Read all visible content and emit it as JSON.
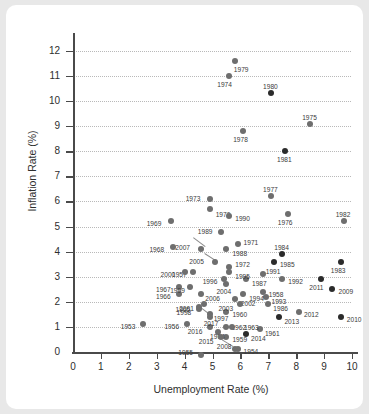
{
  "chart_data": {
    "type": "scatter",
    "title": "",
    "xlabel": "Unemployment Rate (%)",
    "ylabel": "Inflation Rate (%)",
    "xlim": [
      0,
      10.5
    ],
    "ylim": [
      0,
      12.4
    ],
    "xticks": [
      0,
      1,
      2,
      3,
      4,
      5,
      6,
      7,
      8,
      9,
      10
    ],
    "yticks": [
      0,
      1,
      2,
      3,
      4,
      5,
      6,
      7,
      8,
      9,
      10,
      11,
      12
    ],
    "grid": "horizontal-dotted",
    "legend": "none",
    "point_label_field": "year",
    "points": [
      {
        "year": "1953",
        "x": 2.5,
        "y": 1.1,
        "tone": "mid",
        "lx": -22,
        "ly": -1
      },
      {
        "year": "1954",
        "x": 5.9,
        "y": 0.1,
        "tone": "mid",
        "lx": 6,
        "ly": -1
      },
      {
        "year": "1955",
        "x": 4.6,
        "y": -0.1,
        "tone": "mid",
        "lx": -23,
        "ly": -6
      },
      {
        "year": "1956",
        "x": 4.1,
        "y": 1.1,
        "tone": "mid",
        "lx": -23,
        "ly": -1
      },
      {
        "year": "1957",
        "x": 4.3,
        "y": 3.2,
        "tone": "mid",
        "lx": -21,
        "ly": -1
      },
      {
        "year": "1958",
        "x": 6.8,
        "y": 2.4,
        "tone": "mid",
        "lx": 6,
        "ly": -1
      },
      {
        "year": "1959",
        "x": 5.5,
        "y": 0.6,
        "tone": "mid",
        "lx": 6,
        "ly": -1
      },
      {
        "year": "1960",
        "x": 5.5,
        "y": 1.6,
        "tone": "mid",
        "lx": 6,
        "ly": -1
      },
      {
        "year": "1961",
        "x": 6.7,
        "y": 0.9,
        "tone": "mid",
        "lx": 5,
        "ly": 1
      },
      {
        "year": "1962",
        "x": 5.5,
        "y": 1.0,
        "tone": "mid",
        "lx": 5,
        "ly": -3
      },
      {
        "year": "1963",
        "x": 5.7,
        "y": 1.0,
        "tone": "mid",
        "lx": 12,
        "ly": -3
      },
      {
        "year": "1964",
        "x": 5.2,
        "y": 0.8,
        "tone": "mid",
        "lx": -8,
        "ly": 1
      },
      {
        "year": "1965",
        "x": 4.5,
        "y": 1.8,
        "tone": "mid",
        "lx": -23,
        "ly": -1
      },
      {
        "year": "1966",
        "x": 3.8,
        "y": 2.3,
        "tone": "mid",
        "lx": -23,
        "ly": -1
      },
      {
        "year": "1967",
        "x": 3.8,
        "y": 2.6,
        "tone": "mid",
        "lx": -23,
        "ly": -1
      },
      {
        "year": "1968",
        "x": 3.6,
        "y": 4.2,
        "tone": "mid",
        "lx": -24,
        "ly": -1
      },
      {
        "year": "1969",
        "x": 3.5,
        "y": 5.2,
        "tone": "mid",
        "lx": -24,
        "ly": -1
      },
      {
        "year": "1970",
        "x": 4.9,
        "y": 5.7,
        "tone": "mid",
        "lx": 6,
        "ly": 2
      },
      {
        "year": "1971",
        "x": 5.9,
        "y": 4.3,
        "tone": "mid",
        "lx": 6,
        "ly": -5
      },
      {
        "year": "1972",
        "x": 5.6,
        "y": 3.4,
        "tone": "mid",
        "lx": 6,
        "ly": -6
      },
      {
        "year": "1973",
        "x": 4.9,
        "y": 6.1,
        "tone": "mid",
        "lx": -24,
        "ly": -4
      },
      {
        "year": "1974",
        "x": 5.6,
        "y": 11.0,
        "tone": "mid",
        "lx": -12,
        "ly": 5
      },
      {
        "year": "1975",
        "x": 8.5,
        "y": 9.1,
        "tone": "mid",
        "lx": -8,
        "ly": -10
      },
      {
        "year": "1976",
        "x": 7.7,
        "y": 5.5,
        "tone": "mid",
        "lx": -10,
        "ly": 5
      },
      {
        "year": "1977",
        "x": 7.1,
        "y": 6.2,
        "tone": "mid",
        "lx": -8,
        "ly": -10
      },
      {
        "year": "1978",
        "x": 6.1,
        "y": 8.8,
        "tone": "mid",
        "lx": -10,
        "ly": 5
      },
      {
        "year": "1979",
        "x": 5.8,
        "y": 11.6,
        "tone": "mid",
        "lx": -1,
        "ly": 5
      },
      {
        "year": "1980",
        "x": 7.1,
        "y": 10.3,
        "tone": "dark",
        "lx": -8,
        "ly": -10
      },
      {
        "year": "1981",
        "x": 7.6,
        "y": 8.0,
        "tone": "dark",
        "lx": -8,
        "ly": 5
      },
      {
        "year": "1982",
        "x": 9.7,
        "y": 5.2,
        "tone": "mid",
        "lx": -8,
        "ly": -10
      },
      {
        "year": "1983",
        "x": 9.6,
        "y": 3.6,
        "tone": "dark",
        "lx": -10,
        "ly": 5
      },
      {
        "year": "1984",
        "x": 7.5,
        "y": 3.9,
        "tone": "dark",
        "lx": -8,
        "ly": -10
      },
      {
        "year": "1985",
        "x": 7.2,
        "y": 3.6,
        "tone": "dark",
        "lx": 6,
        "ly": -1
      },
      {
        "year": "1986",
        "x": 7.0,
        "y": 1.9,
        "tone": "mid",
        "lx": 5,
        "ly": 1
      },
      {
        "year": "1987",
        "x": 6.2,
        "y": 2.9,
        "tone": "mid",
        "lx": 6,
        "ly": 1
      },
      {
        "year": "1988",
        "x": 5.5,
        "y": 4.1,
        "tone": "mid",
        "lx": 6,
        "ly": 1
      },
      {
        "year": "1989",
        "x": 5.3,
        "y": 4.8,
        "tone": "mid",
        "lx": -23,
        "ly": -4
      },
      {
        "year": "1990",
        "x": 5.6,
        "y": 5.4,
        "tone": "mid",
        "lx": 6,
        "ly": -1
      },
      {
        "year": "1991",
        "x": 6.8,
        "y": 3.1,
        "tone": "mid",
        "lx": 3,
        "ly": -6
      },
      {
        "year": "1992",
        "x": 7.5,
        "y": 2.9,
        "tone": "mid",
        "lx": 6,
        "ly": -1
      },
      {
        "year": "1993",
        "x": 6.9,
        "y": 2.2,
        "tone": "mid",
        "lx": 6,
        "ly": 1
      },
      {
        "year": "1994",
        "x": 6.1,
        "y": 2.3,
        "tone": "mid",
        "lx": 6,
        "ly": 1
      },
      {
        "year": "1995",
        "x": 5.6,
        "y": 3.2,
        "tone": "mid",
        "lx": 6,
        "ly": 1
      },
      {
        "year": "1996",
        "x": 5.4,
        "y": 2.9,
        "tone": "mid",
        "lx": -21,
        "ly": -1
      },
      {
        "year": "1997",
        "x": 4.9,
        "y": 1.5,
        "tone": "mid",
        "lx": 4,
        "ly": 1
      },
      {
        "year": "1998",
        "x": 4.5,
        "y": 1.7,
        "tone": "mid",
        "lx": -22,
        "ly": 0
      },
      {
        "year": "1999",
        "x": 4.2,
        "y": 2.6,
        "tone": "mid",
        "lx": -20,
        "ly": 0
      },
      {
        "year": "2000",
        "x": 4.0,
        "y": 3.2,
        "tone": "mid",
        "lx": -24,
        "ly": -1
      },
      {
        "year": "2001",
        "x": 4.7,
        "y": 1.9,
        "tone": "mid",
        "lx": -25,
        "ly": 1
      },
      {
        "year": "2002",
        "x": 5.8,
        "y": 2.1,
        "tone": "mid",
        "lx": 6,
        "ly": 1
      },
      {
        "year": "2003",
        "x": 6.0,
        "y": 1.9,
        "tone": "mid",
        "lx": -22,
        "ly": 1
      },
      {
        "year": "2004",
        "x": 5.5,
        "y": 2.7,
        "tone": "mid",
        "lx": -10,
        "ly": 4
      },
      {
        "year": "2005",
        "x": 5.1,
        "y": 3.6,
        "tone": "mid",
        "lx": -26,
        "ly": -4
      },
      {
        "year": "2006",
        "x": 4.6,
        "y": 2.3,
        "tone": "mid",
        "lx": 4,
        "ly": 1
      },
      {
        "year": "2007",
        "x": 4.6,
        "y": 4.1,
        "tone": "mid",
        "lx": -26,
        "ly": -5
      },
      {
        "year": "2008",
        "x": 5.8,
        "y": 0.1,
        "tone": "mid",
        "lx": -18,
        "ly": -6
      },
      {
        "year": "2009",
        "x": 9.3,
        "y": 2.5,
        "tone": "dark",
        "lx": 6,
        "ly": -1
      },
      {
        "year": "2010",
        "x": 9.6,
        "y": 1.4,
        "tone": "dark",
        "lx": 6,
        "ly": -1
      },
      {
        "year": "2011",
        "x": 8.9,
        "y": 2.9,
        "tone": "dark",
        "lx": -12,
        "ly": 5
      },
      {
        "year": "2012",
        "x": 8.1,
        "y": 1.6,
        "tone": "mid",
        "lx": 5,
        "ly": -1
      },
      {
        "year": "2013",
        "x": 7.4,
        "y": 1.4,
        "tone": "dark",
        "lx": 5,
        "ly": 1
      },
      {
        "year": "2014",
        "x": 6.2,
        "y": 0.7,
        "tone": "dark",
        "lx": 5,
        "ly": 1
      },
      {
        "year": "2015",
        "x": 5.3,
        "y": 0.6,
        "tone": "mid",
        "lx": -22,
        "ly": 1
      },
      {
        "year": "2016",
        "x": 4.9,
        "y": 1.0,
        "tone": "mid",
        "lx": -22,
        "ly": 1
      },
      {
        "year": "2017",
        "x": 4.9,
        "y": 1.4,
        "tone": "mid",
        "lx": -6,
        "ly": 3
      }
    ],
    "leaders": [
      {
        "x1": 4.72,
        "y1": 4.18,
        "x2": 4.28,
        "y2": 4.55
      },
      {
        "x1": 5.15,
        "y1": 3.58,
        "x2": 4.7,
        "y2": 3.9
      },
      {
        "x1": 4.95,
        "y1": 1.45,
        "x2": 4.6,
        "y2": 1.75
      },
      {
        "x1": 5.75,
        "y1": 0.18,
        "x2": 5.35,
        "y2": 0.45
      }
    ]
  },
  "axes": {
    "y_title": "Inflation Rate (%)",
    "x_title": "Unemployment Rate (%)",
    "y_tick_labels": [
      "0",
      "1",
      "2",
      "3",
      "4",
      "5",
      "6",
      "7",
      "8",
      "9",
      "10",
      "11",
      "12"
    ],
    "x_tick_labels": [
      "0",
      "1",
      "2",
      "3",
      "4",
      "5",
      "6",
      "7",
      "8",
      "9",
      "10"
    ]
  },
  "colors": {
    "page_background": "#e8e8e8",
    "card_background": "#ffffff",
    "axis": "#4a4a4a",
    "gridline": "#b9b9b9",
    "dot_light": "#8f8f8f",
    "dot_dark": "#2b2b2b",
    "text": "#2e2e2e"
  }
}
